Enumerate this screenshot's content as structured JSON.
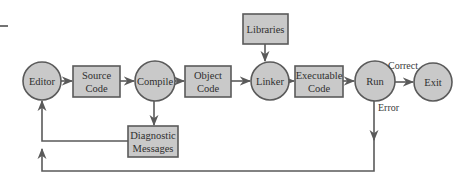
{
  "diagram": {
    "type": "flowchart",
    "colors": {
      "node_fill": "#c9c9c9",
      "node_stroke": "#5a5a5a",
      "edge": "#5a5a5a",
      "text": "#2f2f2f"
    },
    "nodes": [
      {
        "id": "editor",
        "shape": "circle",
        "label": [
          "Editor"
        ]
      },
      {
        "id": "source",
        "shape": "box",
        "label": [
          "Source",
          "Code"
        ]
      },
      {
        "id": "compile",
        "shape": "circle",
        "label": [
          "Compile"
        ]
      },
      {
        "id": "object",
        "shape": "box",
        "label": [
          "Object",
          "Code"
        ]
      },
      {
        "id": "linker",
        "shape": "circle",
        "label": [
          "Linker"
        ]
      },
      {
        "id": "libraries",
        "shape": "box",
        "label": [
          "Libraries"
        ]
      },
      {
        "id": "executable",
        "shape": "box",
        "label": [
          "Executable",
          "Code"
        ]
      },
      {
        "id": "run",
        "shape": "circle",
        "label": [
          "Run"
        ]
      },
      {
        "id": "exit",
        "shape": "circle",
        "label": [
          "Exit"
        ]
      },
      {
        "id": "diagnostic",
        "shape": "box",
        "label": [
          "Diagnostic",
          "Messages"
        ]
      }
    ],
    "edges": [
      {
        "from": "editor",
        "to": "source",
        "label": ""
      },
      {
        "from": "source",
        "to": "compile",
        "label": ""
      },
      {
        "from": "compile",
        "to": "object",
        "label": ""
      },
      {
        "from": "object",
        "to": "linker",
        "label": ""
      },
      {
        "from": "libraries",
        "to": "linker",
        "label": ""
      },
      {
        "from": "linker",
        "to": "executable",
        "label": ""
      },
      {
        "from": "executable",
        "to": "run",
        "label": ""
      },
      {
        "from": "run",
        "to": "exit",
        "label": "Correct"
      },
      {
        "from": "compile",
        "to": "diagnostic",
        "label": ""
      },
      {
        "from": "diagnostic",
        "to": "editor",
        "label": ""
      },
      {
        "from": "run",
        "to": "editor",
        "label": "Error"
      }
    ],
    "labels": {
      "editor": "Editor",
      "source_1": "Source",
      "source_2": "Code",
      "compile": "Compile",
      "object_1": "Object",
      "object_2": "Code",
      "linker": "Linker",
      "libraries": "Libraries",
      "executable_1": "Executable",
      "executable_2": "Code",
      "run": "Run",
      "exit": "Exit",
      "diagnostic_1": "Diagnostic",
      "diagnostic_2": "Messages",
      "correct": "Correct",
      "error": "Error"
    }
  }
}
